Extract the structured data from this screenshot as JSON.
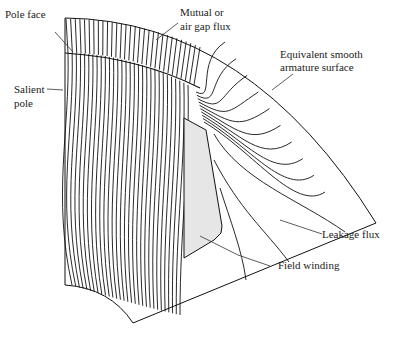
{
  "figure": {
    "labels": {
      "pole_face": "Pole face",
      "mutual_l1": "Mutual or",
      "mutual_l2": "air gap flux",
      "armature_l1": "Equivalent smooth",
      "armature_l2": "armature surface",
      "salient_l1": "Salient",
      "salient_l2": "pole",
      "leakage": "Leakage flux",
      "field": "Field winding"
    },
    "colors": {
      "line": "#111111",
      "winding_fill": "#e6e6e6",
      "label": "#222222"
    }
  }
}
